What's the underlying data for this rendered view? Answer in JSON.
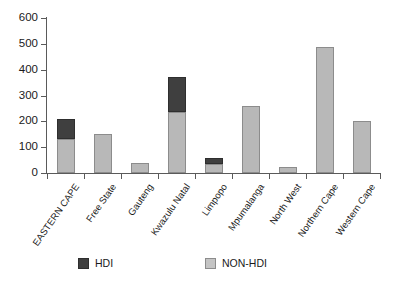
{
  "chart_data": {
    "type": "bar",
    "stacked": true,
    "title": "",
    "subtitle": "",
    "xlabel": "",
    "ylabel": "",
    "ylim": [
      0,
      600
    ],
    "ytick_labels": [
      "0",
      "100",
      "200",
      "300",
      "400",
      "500",
      "600"
    ],
    "ytick_values": [
      0,
      100,
      200,
      300,
      400,
      500,
      600
    ],
    "grid": false,
    "legend_position": "bottom",
    "categories": [
      "EASTERN CAPE",
      "Free State",
      "Gauteng",
      "Kwazulu Natal",
      "Limpopo",
      "Mpumalanga",
      "North West",
      "Northern Cape",
      "Western Cape"
    ],
    "series": [
      {
        "name": "NON-HDI",
        "color": "#b8b8b8",
        "values": [
          132,
          151,
          40,
          236,
          33,
          259,
          25,
          488,
          203
        ]
      },
      {
        "name": "HDI",
        "color": "#3f3f3f",
        "values": [
          77,
          0,
          0,
          136,
          25,
          0,
          0,
          0,
          0
        ]
      }
    ],
    "totals": [
      209,
      151,
      40,
      372,
      58,
      259,
      25,
      488,
      203
    ]
  },
  "legend": {
    "items": [
      {
        "label": "HDI",
        "swatch": "hdi"
      },
      {
        "label": "NON-HDI",
        "swatch": "non"
      }
    ]
  },
  "colors": {
    "hdi": "#3f3f3f",
    "non_hdi": "#b8b8b8",
    "axis": "#5a5a5a",
    "text": "#1a1a1a",
    "background": "#ffffff"
  }
}
